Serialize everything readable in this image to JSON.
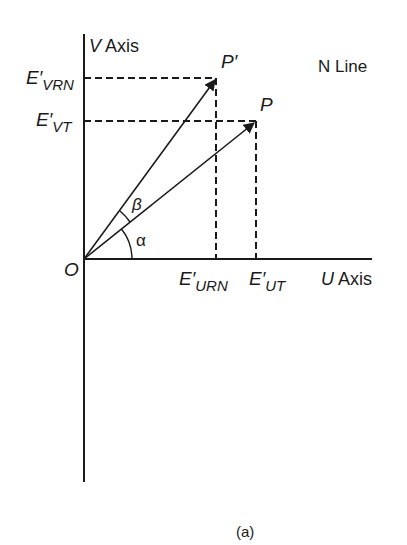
{
  "figure": {
    "caption": "(a)",
    "axes": {
      "v_axis": {
        "var": "V",
        "word": "Axis"
      },
      "u_axis": {
        "var": "U",
        "word": "Axis"
      },
      "origin": "O"
    },
    "annotation": "N Line",
    "points": {
      "p": "P",
      "p_prime": "P′"
    },
    "angles": {
      "alpha": "α",
      "beta": "β"
    },
    "projections": {
      "e_vrn": {
        "base": "E′",
        "sub": "VRN"
      },
      "e_vt": {
        "base": "E′",
        "sub": "VT"
      },
      "e_urn": {
        "base": "E′",
        "sub": "URN"
      },
      "e_ut": {
        "base": "E′",
        "sub": "UT"
      }
    },
    "colors": {
      "ink": "#1a1a1a",
      "background": "#ffffff"
    }
  }
}
